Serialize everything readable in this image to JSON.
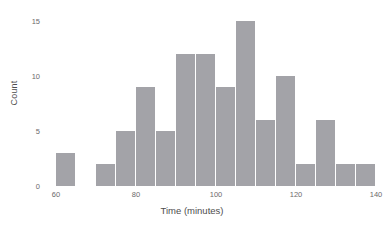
{
  "chart_data": {
    "type": "bar",
    "title": "",
    "subtitle": "",
    "xlabel": "Time (minutes)",
    "ylabel": "Count",
    "xlim": [
      57.5,
      140
    ],
    "ylim": [
      0,
      15.8
    ],
    "grid": false,
    "legend": null,
    "bin_width": 5,
    "bar_color": "#a3a3a8",
    "background_color": "#ffffff",
    "x_ticks": [
      {
        "value": 60,
        "label": "60"
      },
      {
        "value": 80,
        "label": "80"
      },
      {
        "value": 100,
        "label": "100"
      },
      {
        "value": 120,
        "label": "120"
      },
      {
        "value": 140,
        "label": "140"
      }
    ],
    "y_ticks": [
      {
        "value": 0,
        "label": "0"
      },
      {
        "value": 5,
        "label": "5"
      },
      {
        "value": 10,
        "label": "10"
      },
      {
        "value": 15,
        "label": "15"
      }
    ],
    "categories": [
      "60-65",
      "65-70",
      "70-75",
      "75-80",
      "80-85",
      "85-90",
      "90-95",
      "95-100",
      "100-105",
      "105-110",
      "110-115",
      "115-120",
      "120-125",
      "125-130",
      "130-135",
      "135-140"
    ],
    "bins": [
      {
        "start": 60,
        "end": 65,
        "value": 3
      },
      {
        "start": 65,
        "end": 70,
        "value": 0
      },
      {
        "start": 70,
        "end": 75,
        "value": 2
      },
      {
        "start": 75,
        "end": 80,
        "value": 5
      },
      {
        "start": 80,
        "end": 85,
        "value": 9
      },
      {
        "start": 85,
        "end": 90,
        "value": 5
      },
      {
        "start": 90,
        "end": 95,
        "value": 12
      },
      {
        "start": 95,
        "end": 100,
        "value": 12
      },
      {
        "start": 100,
        "end": 105,
        "value": 9
      },
      {
        "start": 105,
        "end": 110,
        "value": 15
      },
      {
        "start": 110,
        "end": 115,
        "value": 6
      },
      {
        "start": 115,
        "end": 120,
        "value": 10
      },
      {
        "start": 120,
        "end": 125,
        "value": 2
      },
      {
        "start": 125,
        "end": 130,
        "value": 6
      },
      {
        "start": 130,
        "end": 135,
        "value": 2
      },
      {
        "start": 135,
        "end": 140,
        "value": 2
      }
    ],
    "values": [
      3,
      0,
      2,
      5,
      9,
      5,
      12,
      12,
      9,
      15,
      6,
      10,
      2,
      6,
      2,
      2
    ]
  }
}
